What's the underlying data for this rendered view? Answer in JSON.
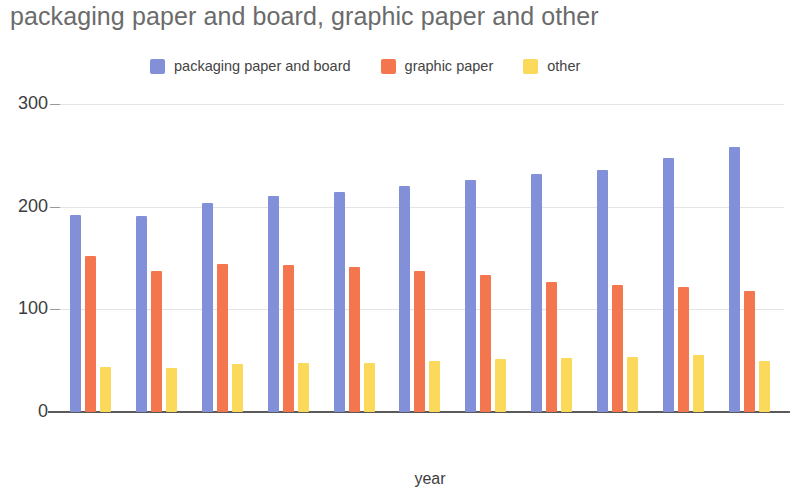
{
  "chart_data": {
    "type": "bar",
    "title": "packaging paper and board, graphic paper and other",
    "xlabel": "year",
    "ylabel": "",
    "ylim": [
      0,
      300
    ],
    "yticks": [
      0,
      100,
      200,
      300
    ],
    "grid": true,
    "legend_position": "top-center",
    "categories": [
      "2008",
      "2009",
      "2010",
      "2011",
      "2012",
      "2013",
      "2014",
      "2015",
      "2016",
      "2017",
      "2018"
    ],
    "series": [
      {
        "name": "packaging paper and board",
        "color": "#8190d9",
        "values": [
          192,
          191,
          204,
          210,
          214,
          220,
          226,
          232,
          236,
          247,
          258
        ]
      },
      {
        "name": "graphic paper",
        "color": "#f4764f",
        "values": [
          152,
          137,
          144,
          143,
          141,
          137,
          133,
          127,
          124,
          122,
          118
        ]
      },
      {
        "name": "other",
        "color": "#fad95b",
        "values": [
          44,
          43,
          47,
          48,
          48,
          50,
          52,
          53,
          54,
          56,
          50
        ]
      }
    ]
  },
  "colors": {
    "title_text": "#6b6b6b",
    "axis_text": "#3d3d3d",
    "gridline": "#e4e4e4",
    "baseline": "#5a5a5a",
    "background": "#ffffff"
  }
}
